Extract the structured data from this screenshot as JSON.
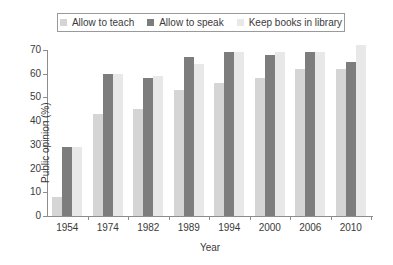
{
  "chart_data": {
    "type": "bar",
    "title": "",
    "xlabel": "Year",
    "ylabel": "Public opinion (%)",
    "categories": [
      "1954",
      "1974",
      "1982",
      "1989",
      "1994",
      "2000",
      "2006",
      "2010"
    ],
    "series": [
      {
        "name": "Allow to teach",
        "color": "#d5d5d5",
        "values": [
          8,
          43,
          45,
          53,
          56,
          58,
          62,
          62
        ]
      },
      {
        "name": "Allow to speak",
        "color": "#7d7d7d",
        "values": [
          29,
          60,
          58,
          67,
          69,
          68,
          69,
          65
        ]
      },
      {
        "name": "Keep books in library",
        "color": "#e8e8e8",
        "values": [
          29,
          60,
          59,
          64,
          69,
          69,
          69,
          72
        ]
      }
    ],
    "ylim": [
      0,
      70
    ],
    "yticks": [
      0,
      10,
      20,
      30,
      40,
      50,
      60,
      70
    ],
    "ytick_labels": [
      "0",
      "10",
      "20",
      "30",
      "40",
      "50",
      "60",
      "70"
    ],
    "grid": false,
    "legend_position": "top-center"
  },
  "axis": {
    "axis_color": "#8d8d8d",
    "text_color": "#3a3a3a"
  }
}
